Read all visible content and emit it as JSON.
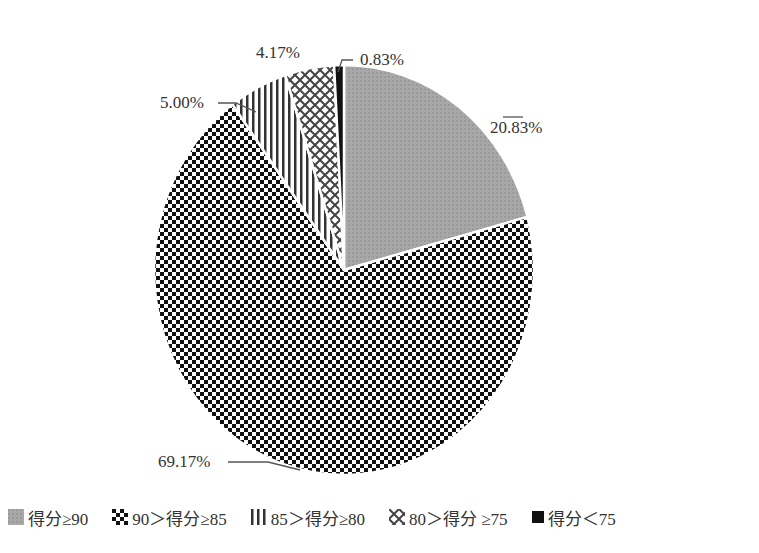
{
  "chart_data": {
    "type": "pie",
    "title": "",
    "start_angle": "12 o'clock",
    "direction": "clockwise",
    "slices": [
      {
        "label": "得分≥90",
        "value": 20.83,
        "display": "20.83%",
        "pattern": "fine-gray"
      },
      {
        "label": "90＞得分≥85",
        "value": 69.17,
        "display": "69.17%",
        "pattern": "checkerboard"
      },
      {
        "label": "85＞得分≥80",
        "value": 5.0,
        "display": "5.00%",
        "pattern": "vertical-lines"
      },
      {
        "label": "80＞得分 ≥75",
        "value": 4.17,
        "display": "4.17%",
        "pattern": "crosshatch"
      },
      {
        "label": "得分＜75",
        "value": 0.83,
        "display": "0.83%",
        "pattern": "solid-black"
      }
    ],
    "legend_position": "bottom"
  },
  "labels": {
    "s0": "20.83%",
    "s1": "69.17%",
    "s2": "5.00%",
    "s3": "4.17%",
    "s4": "0.83%"
  },
  "legend": [
    {
      "label": "得分≥90"
    },
    {
      "label": "90＞得分≥85"
    },
    {
      "label": "85＞得分≥80"
    },
    {
      "label": "80＞得分 ≥75"
    },
    {
      "label": "得分＜75"
    }
  ]
}
